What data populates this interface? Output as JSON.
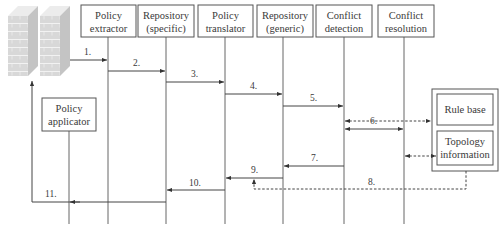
{
  "diagram": {
    "type": "sequence",
    "participants": [
      {
        "id": "firewalls",
        "label": "",
        "icon": "firewall-icon"
      },
      {
        "id": "extractor",
        "label_line1": "Policy",
        "label_line2": "extractor"
      },
      {
        "id": "repo_specific",
        "label_line1": "Repository",
        "label_line2": "(specific)"
      },
      {
        "id": "translator",
        "label_line1": "Policy",
        "label_line2": "translator"
      },
      {
        "id": "repo_generic",
        "label_line1": "Repository",
        "label_line2": "(generic)"
      },
      {
        "id": "detection",
        "label_line1": "Conflict",
        "label_line2": "detection"
      },
      {
        "id": "resolution",
        "label_line1": "Conflict",
        "label_line2": "resolution"
      },
      {
        "id": "applicator",
        "label_line1": "Policy",
        "label_line2": "applicator"
      }
    ],
    "data_store": {
      "rule_base": "Rule base",
      "topology_line1": "Topology",
      "topology_line2": "information"
    },
    "messages": [
      {
        "label": "1.",
        "from": "firewalls",
        "to": "extractor",
        "style": "solid"
      },
      {
        "label": "2.",
        "from": "extractor",
        "to": "repo_specific",
        "style": "solid"
      },
      {
        "label": "3.",
        "from": "repo_specific",
        "to": "translator",
        "style": "solid"
      },
      {
        "label": "4.",
        "from": "translator",
        "to": "repo_generic",
        "style": "solid"
      },
      {
        "label": "5.",
        "from": "repo_generic",
        "to": "detection",
        "style": "solid"
      },
      {
        "label": "",
        "from": "detection",
        "to": "rule_base",
        "style": "dashed-bidirectional"
      },
      {
        "label": "6.",
        "from": "detection",
        "to": "resolution",
        "style": "solid-bidirectional"
      },
      {
        "label": "",
        "from": "resolution",
        "to": "topology",
        "style": "dashed-bidirectional"
      },
      {
        "label": "7.",
        "from": "detection",
        "to": "repo_generic",
        "style": "solid"
      },
      {
        "label": "8.",
        "from": "topology",
        "to": "repo_generic",
        "style": "dashed"
      },
      {
        "label": "9.",
        "from": "repo_generic",
        "to": "translator",
        "style": "solid"
      },
      {
        "label": "10.",
        "from": "translator",
        "to": "repo_specific",
        "style": "solid"
      },
      {
        "label": "11.",
        "from": "repo_specific",
        "to": "firewalls",
        "style": "solid"
      }
    ]
  }
}
